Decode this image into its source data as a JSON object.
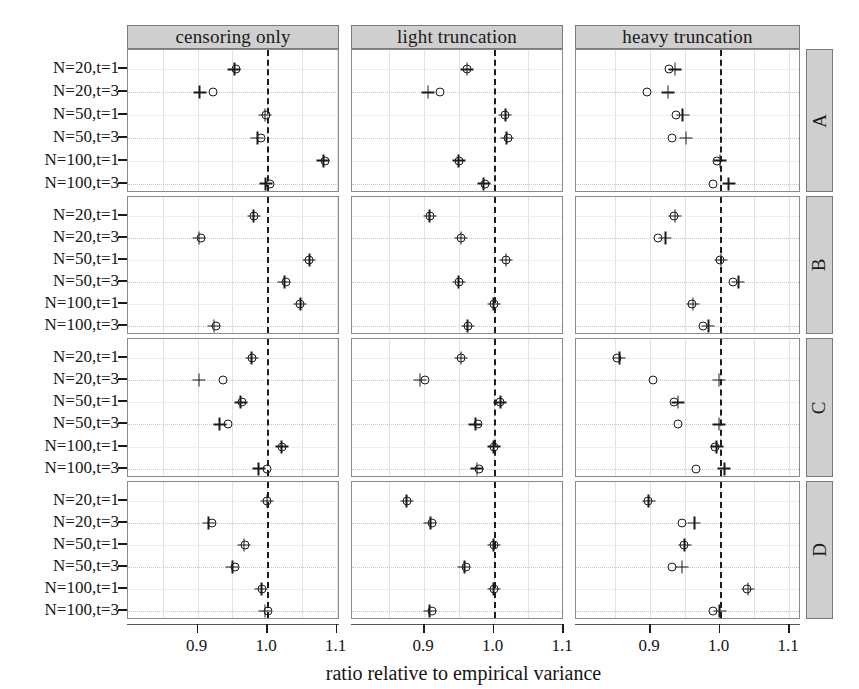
{
  "figure": {
    "xlabel": "ratio relative to empirical variance",
    "column_headers": [
      "censoring only",
      "light truncation",
      "heavy truncation"
    ],
    "row_headers": [
      "A",
      "B",
      "C",
      "D"
    ],
    "y_categories": [
      "N=20,t=1",
      "N=20,t=3",
      "N=50,t=1",
      "N=50,t=3",
      "N=100,t=1",
      "N=100,t=3"
    ],
    "x_ticks": [
      "0.9",
      "1.0",
      "1.1"
    ],
    "reference_value": "1.00",
    "strip_color": "#cfcfcf",
    "marker_color": "#1a1a1a"
  },
  "chart_data": {
    "type": "scatter",
    "title": "",
    "xlabel": "ratio relative to empirical variance",
    "ylabel": "",
    "xlim": [
      0.845,
      1.145
    ],
    "grid": true,
    "legend": [],
    "reference_line_x": 1.0,
    "columns": [
      "censoring only",
      "light truncation",
      "heavy truncation"
    ],
    "rows": [
      "A",
      "B",
      "C",
      "D"
    ],
    "categories": [
      "N=20,t=1",
      "N=20,t=3",
      "N=50,t=1",
      "N=50,t=3",
      "N=100,t=1",
      "N=100,t=3"
    ],
    "series_names": [
      "circle",
      "plus"
    ],
    "panels": [
      {
        "row": "A",
        "column": "censoring only",
        "circle": [
          0.955,
          0.922,
          0.998,
          0.992,
          1.083,
          1.005
        ],
        "plus": [
          0.953,
          0.903,
          0.997,
          0.986,
          1.081,
          0.998
        ]
      },
      {
        "row": "A",
        "column": "light truncation",
        "circle": [
          0.962,
          0.923,
          1.017,
          1.021,
          0.95,
          0.988
        ],
        "plus": [
          0.962,
          0.906,
          1.017,
          1.019,
          0.95,
          0.986
        ]
      },
      {
        "row": "A",
        "column": "heavy truncation",
        "circle": [
          0.927,
          0.896,
          0.938,
          0.931,
          0.997,
          0.991
        ],
        "plus": [
          0.936,
          0.926,
          0.947,
          0.952,
          1.001,
          1.013
        ]
      },
      {
        "row": "B",
        "column": "censoring only",
        "circle": [
          0.981,
          0.905,
          1.061,
          1.028,
          1.048,
          0.926
        ],
        "plus": [
          0.981,
          0.902,
          1.061,
          1.025,
          1.048,
          0.924
        ]
      },
      {
        "row": "B",
        "column": "light truncation",
        "circle": [
          0.908,
          0.953,
          1.018,
          0.95,
          1.0,
          0.963
        ],
        "plus": [
          0.908,
          0.953,
          1.018,
          0.95,
          1.0,
          0.963
        ]
      },
      {
        "row": "B",
        "column": "heavy truncation",
        "circle": [
          0.934,
          0.912,
          1.001,
          1.019,
          0.961,
          0.976
        ],
        "plus": [
          0.936,
          0.922,
          1.002,
          1.027,
          0.962,
          0.984
        ]
      },
      {
        "row": "C",
        "column": "censoring only",
        "circle": [
          0.979,
          0.937,
          0.964,
          0.944,
          1.022,
          1.0
        ],
        "plus": [
          0.978,
          0.902,
          0.962,
          0.932,
          1.021,
          0.988
        ]
      },
      {
        "row": "C",
        "column": "light truncation",
        "circle": [
          0.953,
          0.901,
          1.01,
          0.978,
          1.0,
          0.979
        ],
        "plus": [
          0.953,
          0.894,
          1.01,
          0.974,
          1.0,
          0.976
        ]
      },
      {
        "row": "C",
        "column": "heavy truncation",
        "circle": [
          0.852,
          0.905,
          0.934,
          0.941,
          0.993,
          0.966
        ],
        "plus": [
          0.856,
          0.999,
          0.94,
          0.999,
          0.996,
          1.007
        ]
      },
      {
        "row": "D",
        "column": "censoring only",
        "circle": [
          1.0,
          0.921,
          0.968,
          0.954,
          0.993,
          1.001
        ],
        "plus": [
          1.0,
          0.916,
          0.967,
          0.95,
          0.992,
          0.997
        ]
      },
      {
        "row": "D",
        "column": "light truncation",
        "circle": [
          0.875,
          0.912,
          1.0,
          0.961,
          1.0,
          0.911
        ],
        "plus": [
          0.875,
          0.909,
          1.0,
          0.958,
          1.0,
          0.908
        ]
      },
      {
        "row": "D",
        "column": "heavy truncation",
        "circle": [
          0.897,
          0.946,
          0.949,
          0.932,
          1.04,
          0.991
        ],
        "plus": [
          0.898,
          0.964,
          0.95,
          0.946,
          1.041,
          1.0
        ]
      }
    ]
  }
}
